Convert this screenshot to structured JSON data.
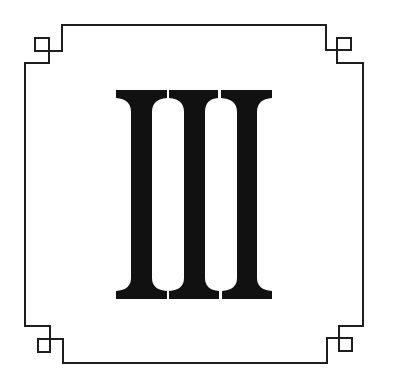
{
  "emblem": {
    "numeral": "III",
    "numeral_value": 3,
    "frame_style": "square frame with stepped corners and small corner squares",
    "colors": {
      "background": "#ffffff",
      "frame_stroke": "#1e1e1e",
      "numeral_fill": "#111111"
    }
  }
}
